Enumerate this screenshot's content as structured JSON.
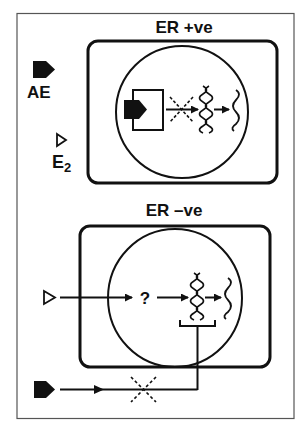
{
  "colors": {
    "ink": "#111111",
    "frame": "#555555",
    "background": "#ffffff"
  },
  "legend": {
    "filled_ligand_label": "AE",
    "outline_ligand_label": "E",
    "outline_ligand_subscript": "2"
  },
  "panels": [
    {
      "id": "er-positive",
      "title": "ER +ve",
      "elements": [
        "receptor-box-with-bound-AE",
        "blocked-arrow",
        "dna-helix",
        "arrow",
        "mrna-wave"
      ]
    },
    {
      "id": "er-negative",
      "title": "ER –ve",
      "unknown_mediator": "?",
      "elements": [
        "E2-input-arrow",
        "unknown-mediator",
        "arrow",
        "dna-helix",
        "arrow",
        "mrna-wave",
        "bracket",
        "AE-blocked-pathway"
      ]
    }
  ],
  "icons": {
    "filled_ligand": "filled-pentagon-icon",
    "outline_ligand": "outline-triangle-icon",
    "dna": "double-helix-icon",
    "mrna": "wavy-line-icon",
    "block": "dashed-x-icon"
  }
}
